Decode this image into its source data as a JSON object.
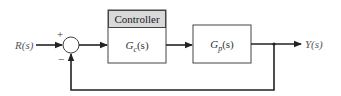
{
  "diagram": {
    "input_label": "R(s)",
    "output_label": "Y(s)",
    "summing_junction": {
      "plus_sign": "+",
      "minus_sign": "−"
    },
    "controller": {
      "header": "Controller",
      "transfer_function": "Gc(s)",
      "tf_main": "G",
      "tf_sub": "c",
      "tf_arg": "(s)"
    },
    "plant": {
      "transfer_function": "Gp(s)",
      "tf_main": "G",
      "tf_sub": "p",
      "tf_arg": "(s)"
    },
    "colors": {
      "line": "#222222",
      "header_fill": "#d9d9d9",
      "box_border": "#444444"
    }
  }
}
